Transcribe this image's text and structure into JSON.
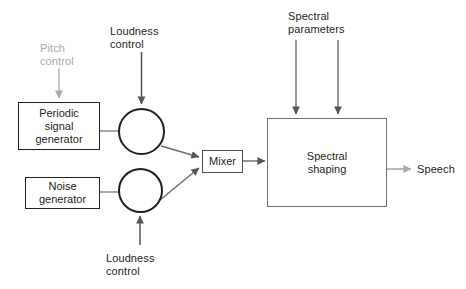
{
  "diagram": {
    "colors": {
      "ink": "#231f20",
      "wire": "#6f6f6f",
      "wire_dark": "#555555",
      "muted_text": "#a7a7a7",
      "background": "#ffffff"
    },
    "labels": [
      {
        "id": "pitch-control",
        "text": "Pitch\ncontrol",
        "muted": true,
        "x": 40,
        "y": 42,
        "w": 60
      },
      {
        "id": "loudness-control-top",
        "text": "Loudness\ncontrol",
        "muted": false,
        "x": 110,
        "y": 25,
        "w": 70
      },
      {
        "id": "spectral-parameters",
        "text": "Spectral\nparameters",
        "muted": false,
        "x": 288,
        "y": 10,
        "w": 80
      },
      {
        "id": "loudness-control-bottom",
        "text": "Loudness\ncontrol",
        "muted": false,
        "x": 106,
        "y": 252,
        "w": 70
      },
      {
        "id": "speech-output",
        "text": "Speech",
        "muted": false,
        "x": 417,
        "y": 164,
        "w": 50
      }
    ],
    "blocks": [
      {
        "id": "periodic-signal-generator",
        "text": "Periodic\nsignal\ngenerator",
        "x": 18,
        "y": 102,
        "w": 82,
        "h": 48,
        "weight": "bold"
      },
      {
        "id": "noise-generator",
        "text": "Noise\ngenerator",
        "x": 25,
        "y": 177,
        "w": 75,
        "h": 32,
        "weight": "bold"
      },
      {
        "id": "mixer",
        "text": "Mixer",
        "x": 202,
        "y": 150,
        "w": 41,
        "h": 23,
        "weight": "bold"
      },
      {
        "id": "spectral-shaping",
        "text": "Spectral\nshaping",
        "x": 267,
        "y": 118,
        "w": 120,
        "h": 89,
        "weight": "light"
      }
    ],
    "circles": [
      {
        "id": "amplitude-modulator-voiced",
        "x": 118,
        "y": 108,
        "d": 47
      },
      {
        "id": "amplitude-modulator-unvoiced",
        "x": 118,
        "y": 168,
        "d": 45
      }
    ],
    "connections": [
      {
        "id": "pitch-to-periodic",
        "from": "pitch-control",
        "to": "periodic-signal-generator",
        "arrow": true,
        "muted": true
      },
      {
        "id": "loudness-to-circle-top",
        "from": "loudness-control-top",
        "to": "amplitude-modulator-voiced",
        "arrow": true,
        "muted": false
      },
      {
        "id": "periodic-to-circle",
        "from": "periodic-signal-generator",
        "to": "amplitude-modulator-voiced",
        "arrow": false,
        "muted": false
      },
      {
        "id": "noise-to-circle",
        "from": "noise-generator",
        "to": "amplitude-modulator-unvoiced",
        "arrow": false,
        "muted": false
      },
      {
        "id": "loudness-to-circle-bottom",
        "from": "loudness-control-bottom",
        "to": "amplitude-modulator-unvoiced",
        "arrow": true,
        "muted": false
      },
      {
        "id": "circle-top-to-mixer",
        "from": "amplitude-modulator-voiced",
        "to": "mixer",
        "arrow": true,
        "muted": false
      },
      {
        "id": "circle-bottom-to-mixer",
        "from": "amplitude-modulator-unvoiced",
        "to": "mixer",
        "arrow": true,
        "muted": false
      },
      {
        "id": "mixer-to-spectral-shaping",
        "from": "mixer",
        "to": "spectral-shaping",
        "arrow": true,
        "muted": false
      },
      {
        "id": "spectral-param-1-to-shaping",
        "from": "spectral-parameters",
        "to": "spectral-shaping",
        "arrow": true,
        "muted": false
      },
      {
        "id": "spectral-param-2-to-shaping",
        "from": "spectral-parameters",
        "to": "spectral-shaping",
        "arrow": true,
        "muted": false
      },
      {
        "id": "shaping-to-speech",
        "from": "spectral-shaping",
        "to": "speech-output",
        "arrow": true,
        "muted": true
      }
    ]
  }
}
